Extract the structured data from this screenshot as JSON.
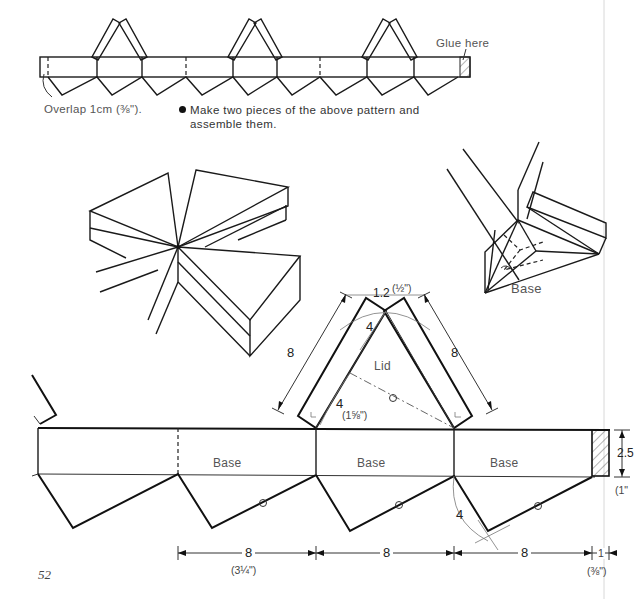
{
  "top_pattern": {
    "glue_label": "Glue here",
    "overlap_label": "Overlap 1cm (⅜\").",
    "instruction": "Make two pieces of the above pattern and",
    "instruction_line2": "assemble them."
  },
  "assembled_view": {
    "base_label": "Base"
  },
  "detail_pattern": {
    "lid_label": "Lid",
    "base_labels": [
      "Base",
      "Base",
      "Base"
    ],
    "dimensions": {
      "lid_side_left": "8",
      "lid_side_right": "8",
      "lid_top_gap": "1.2",
      "lid_top_gap_in": "(½\")",
      "lid_half_upper": "4",
      "lid_half_lower": "4",
      "lid_half_in": "(1⅝\")",
      "base_radius": "4",
      "strip_height": "2.5",
      "strip_height_in": "(1\"",
      "segment_1": "8",
      "segment_1_in": "(3¼\")",
      "segment_2": "8",
      "segment_3": "8",
      "overlap": "1",
      "overlap_in": "(⅜\")"
    }
  },
  "page": {
    "number": "52"
  }
}
